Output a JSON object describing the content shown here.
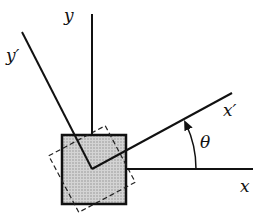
{
  "diagram": {
    "labels": {
      "x": "x",
      "y": "y",
      "x_prime": "x′",
      "y_prime": "y′",
      "theta": "θ"
    },
    "colors": {
      "line": "#111111",
      "element_fill": "#c8c8c8",
      "background": "#ffffff"
    },
    "elements": [
      {
        "name": "x-axis",
        "kind": "axis",
        "style": "solid"
      },
      {
        "name": "y-axis",
        "kind": "axis",
        "style": "solid"
      },
      {
        "name": "x-prime-axis",
        "kind": "rotated-axis",
        "style": "solid"
      },
      {
        "name": "y-prime-axis",
        "kind": "rotated-axis",
        "style": "solid"
      },
      {
        "name": "stress-element",
        "kind": "square",
        "style": "solid shaded"
      },
      {
        "name": "rotated-element",
        "kind": "square",
        "style": "dashed"
      },
      {
        "name": "theta-arc",
        "kind": "angle-arrow",
        "style": "solid"
      }
    ]
  }
}
